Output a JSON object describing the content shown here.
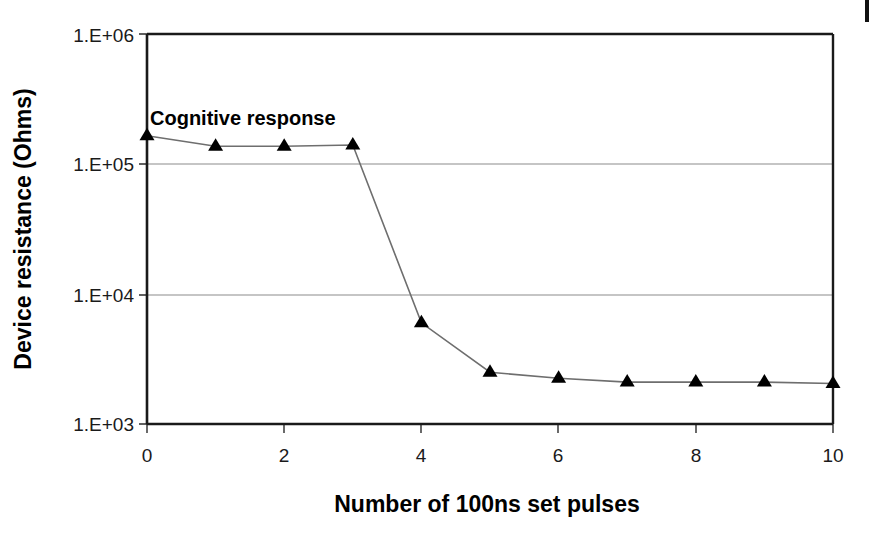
{
  "chart_data": {
    "type": "line",
    "title": "",
    "xlabel": "Number of 100ns set pulses",
    "ylabel": "Device resistance (Ohms)",
    "yscale": "log",
    "xlim": [
      0,
      10
    ],
    "ylim": [
      1000,
      1000000
    ],
    "grid": "horizontal",
    "legend": "none",
    "series": [
      {
        "name": "Cognitive response",
        "marker": "filled-triangle",
        "x": [
          0,
          1,
          2,
          3,
          4,
          5,
          6,
          7,
          8,
          9,
          10
        ],
        "values": [
          165000,
          137000,
          137000,
          140000,
          6000,
          2500,
          2250,
          2100,
          2100,
          2100,
          2050
        ]
      }
    ],
    "annotations": [
      {
        "text": "Cognitive response",
        "x": 0.05,
        "y": 380000
      }
    ],
    "x_ticks": [
      {
        "value": 0,
        "label": "0"
      },
      {
        "value": 2,
        "label": "2"
      },
      {
        "value": 4,
        "label": "4"
      },
      {
        "value": 6,
        "label": "6"
      },
      {
        "value": 8,
        "label": "8"
      },
      {
        "value": 10,
        "label": "10"
      }
    ],
    "y_ticks": [
      {
        "value": 1000000,
        "label": "1.E+06"
      },
      {
        "value": 100000,
        "label": "1.E+05"
      },
      {
        "value": 10000,
        "label": "1.E+04"
      },
      {
        "value": 1000,
        "label": "1.E+03"
      }
    ],
    "colors": {
      "axis": "#1a1a1a",
      "gridline": "#8c8c8c",
      "series_line": "#6e6e6e",
      "marker_fill": "#000000",
      "background": "#ffffff",
      "text": "#000000"
    }
  },
  "figure": {
    "y_tick_0": "1.E+06",
    "y_tick_1": "1.E+05",
    "y_tick_2": "1.E+04",
    "y_tick_3": "1.E+03",
    "x_tick_0": "0",
    "x_tick_1": "2",
    "x_tick_2": "4",
    "x_tick_3": "6",
    "x_tick_4": "8",
    "x_tick_5": "10",
    "y_axis_title": "Device resistance (Ohms)",
    "x_axis_title": "Number of 100ns set pulses",
    "annotation_text": "Cognitive response"
  }
}
